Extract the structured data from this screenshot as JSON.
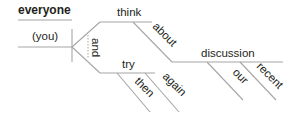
{
  "diagram": {
    "type": "sentence-diagram",
    "subject": {
      "word": "everyone",
      "understood": "(you)"
    },
    "conjunction": "and",
    "predicates": [
      {
        "verb": "think",
        "modifiers": [
          {
            "word": "about",
            "object": {
              "word": "discussion",
              "modifiers": [
                "our",
                "recent"
              ]
            }
          }
        ]
      },
      {
        "verb": "try",
        "modifiers": [
          "then",
          "again"
        ]
      }
    ],
    "colors": {
      "line": "#a6a6a6",
      "text": "#231f20"
    }
  },
  "labels": {
    "everyone": "everyone",
    "you": "(you)",
    "and": "and",
    "think": "think",
    "about": "about",
    "discussion": "discussion",
    "our": "our",
    "recent": "recent",
    "try": "try",
    "then": "then",
    "again": "again"
  }
}
